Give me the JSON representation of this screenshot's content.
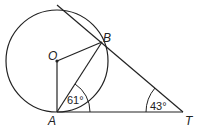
{
  "diagram": {
    "type": "geometry",
    "points": {
      "O": {
        "label": "O",
        "x": 57,
        "y": 61
      },
      "A": {
        "label": "A",
        "x": 57,
        "y": 112
      },
      "B": {
        "label": "B",
        "x": 102,
        "y": 42
      },
      "T": {
        "label": "T",
        "x": 183,
        "y": 112
      }
    },
    "circle": {
      "center": "O",
      "cx": 57,
      "cy": 61,
      "r": 51
    },
    "segments": [
      "OA",
      "OB",
      "AB",
      "AT",
      "BT"
    ],
    "tangent_line": {
      "from": [
        57,
        5
      ],
      "through": "B",
      "to": "T"
    },
    "angles": [
      {
        "vertex": "A",
        "between": [
          "AB",
          "AT"
        ],
        "label": "61°"
      },
      {
        "vertex": "T",
        "between": [
          "TB",
          "TA"
        ],
        "label": "43°"
      }
    ],
    "colors": {
      "stroke": "#222222",
      "background": "#ffffff"
    }
  }
}
